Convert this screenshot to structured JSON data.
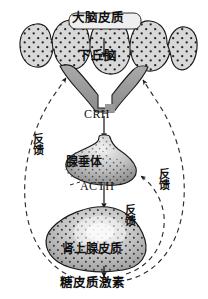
{
  "diagram": {
    "type": "biological-pathway",
    "canvas": {
      "width": 208,
      "height": 299,
      "background": "#ffffff"
    },
    "nodes": [
      {
        "id": "cerebral-cortex",
        "label": "大脑皮质",
        "shape": "gyri-band",
        "fill": "#d6d6d6",
        "stipple": true,
        "stroke": "#1a1a1a"
      },
      {
        "id": "hypothalamus",
        "label": "下丘脑",
        "shape": "v-funnel",
        "fill": "#9a9a9a",
        "stipple": false,
        "stroke": "#1a1a1a"
      },
      {
        "id": "anterior-pituitary",
        "label": "腺垂体",
        "shape": "bulb",
        "fill": "#b5b5b5",
        "stipple": true,
        "stroke": "#1a1a1a"
      },
      {
        "id": "adrenal-cortex",
        "label": "肾上腺皮质",
        "shape": "rounded-mass",
        "fill": "#bdbdbd",
        "stipple": true,
        "stroke": "#1a1a1a"
      }
    ],
    "signals": [
      {
        "id": "crh",
        "label": "CRH",
        "from": "hypothalamus",
        "to": "anterior-pituitary"
      },
      {
        "id": "acth",
        "label": "ACTH",
        "from": "anterior-pituitary",
        "to": "adrenal-cortex"
      },
      {
        "id": "glucocorticoid",
        "label": "糖皮质激素",
        "from": "adrenal-cortex",
        "to": "output"
      }
    ],
    "feedback_loops": [
      {
        "id": "feedback-left",
        "label": "反馈",
        "target": "hypothalamus",
        "side": "left",
        "style": "dashed"
      },
      {
        "id": "feedback-right-outer",
        "label": "反馈",
        "target": "hypothalamus",
        "side": "right",
        "style": "dashed"
      },
      {
        "id": "feedback-right-inner",
        "label": "反馈",
        "target": "anterior-pituitary",
        "side": "right",
        "style": "dashed"
      }
    ],
    "colors": {
      "ink": "#1a1a1a",
      "label_text": "#101010",
      "cortex_fill": "#d6d6d6",
      "hypothalamus_fill": "#9a9a9a",
      "pituitary_fill": "#b5b5b5",
      "adrenal_fill": "#bdbdbd",
      "dashed_line": "#3a3a3a",
      "background": "#ffffff"
    }
  }
}
